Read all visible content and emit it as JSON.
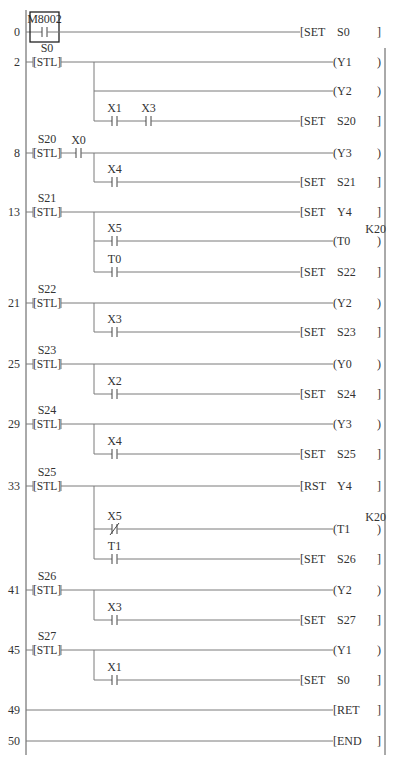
{
  "diagram": {
    "rails": {
      "left_x": 26,
      "right_x": 385,
      "top_y": 10,
      "bottom_y": 755
    },
    "branch_x": 94,
    "coil_x": 333,
    "rungs": [
      {
        "step": "0",
        "y": 32,
        "contacts": [
          {
            "name": "M8002",
            "x": 42,
            "type": "NO",
            "boxed": true
          }
        ],
        "output": {
          "kind": "func",
          "op": "SET",
          "arg": "S0"
        }
      },
      {
        "step": "2",
        "y": 62,
        "stl": "S0",
        "output": {
          "kind": "coil",
          "arg": "Y1"
        }
      },
      {
        "step": "",
        "y": 91,
        "branch": true,
        "output": {
          "kind": "coil",
          "arg": "Y2"
        }
      },
      {
        "step": "",
        "y": 121,
        "branch": true,
        "contacts": [
          {
            "name": "X1",
            "x": 112,
            "type": "NO"
          },
          {
            "name": "X3",
            "x": 146,
            "type": "NO"
          }
        ],
        "output": {
          "kind": "func",
          "op": "SET",
          "arg": "S20"
        }
      },
      {
        "step": "8",
        "y": 153,
        "stl": "S20",
        "contacts": [
          {
            "name": "X0",
            "x": 76,
            "type": "NO"
          }
        ],
        "output": {
          "kind": "coil",
          "arg": "Y3"
        }
      },
      {
        "step": "",
        "y": 182,
        "branch": true,
        "contacts": [
          {
            "name": "X4",
            "x": 112,
            "type": "NO"
          }
        ],
        "output": {
          "kind": "func",
          "op": "SET",
          "arg": "S21"
        }
      },
      {
        "step": "13",
        "y": 212,
        "stl": "S21",
        "output": {
          "kind": "func",
          "op": "SET",
          "arg": "Y4"
        }
      },
      {
        "step": "",
        "y": 241,
        "branch": true,
        "contacts": [
          {
            "name": "X5",
            "x": 112,
            "type": "NO"
          }
        ],
        "output": {
          "kind": "coil",
          "arg": "T0",
          "const": "K20"
        }
      },
      {
        "step": "",
        "y": 272,
        "branch": true,
        "contacts": [
          {
            "name": "T0",
            "x": 112,
            "type": "NO"
          }
        ],
        "output": {
          "kind": "func",
          "op": "SET",
          "arg": "S22"
        }
      },
      {
        "step": "21",
        "y": 303,
        "stl": "S22",
        "output": {
          "kind": "coil",
          "arg": "Y2"
        }
      },
      {
        "step": "",
        "y": 332,
        "branch": true,
        "contacts": [
          {
            "name": "X3",
            "x": 112,
            "type": "NO"
          }
        ],
        "output": {
          "kind": "func",
          "op": "SET",
          "arg": "S23"
        }
      },
      {
        "step": "25",
        "y": 364,
        "stl": "S23",
        "output": {
          "kind": "coil",
          "arg": "Y0"
        }
      },
      {
        "step": "",
        "y": 394,
        "branch": true,
        "contacts": [
          {
            "name": "X2",
            "x": 112,
            "type": "NO"
          }
        ],
        "output": {
          "kind": "func",
          "op": "SET",
          "arg": "S24"
        }
      },
      {
        "step": "29",
        "y": 424,
        "stl": "S24",
        "output": {
          "kind": "coil",
          "arg": "Y3"
        }
      },
      {
        "step": "",
        "y": 454,
        "branch": true,
        "contacts": [
          {
            "name": "X4",
            "x": 112,
            "type": "NO"
          }
        ],
        "output": {
          "kind": "func",
          "op": "SET",
          "arg": "S25"
        }
      },
      {
        "step": "33",
        "y": 486,
        "stl": "S25",
        "output": {
          "kind": "func",
          "op": "RST",
          "arg": "Y4"
        }
      },
      {
        "step": "",
        "y": 529,
        "branch": true,
        "contacts": [
          {
            "name": "X5",
            "x": 112,
            "type": "NC"
          }
        ],
        "output": {
          "kind": "coil",
          "arg": "T1",
          "const": "K20"
        }
      },
      {
        "step": "",
        "y": 559,
        "branch": true,
        "contacts": [
          {
            "name": "T1",
            "x": 112,
            "type": "NO"
          }
        ],
        "output": {
          "kind": "func",
          "op": "SET",
          "arg": "S26"
        }
      },
      {
        "step": "41",
        "y": 590,
        "stl": "S26",
        "output": {
          "kind": "coil",
          "arg": "Y2"
        }
      },
      {
        "step": "",
        "y": 620,
        "branch": true,
        "contacts": [
          {
            "name": "X3",
            "x": 112,
            "type": "NO"
          }
        ],
        "output": {
          "kind": "func",
          "op": "SET",
          "arg": "S27"
        }
      },
      {
        "step": "45",
        "y": 650,
        "stl": "S27",
        "output": {
          "kind": "coil",
          "arg": "Y1"
        }
      },
      {
        "step": "",
        "y": 680,
        "branch": true,
        "contacts": [
          {
            "name": "X1",
            "x": 112,
            "type": "NO"
          }
        ],
        "output": {
          "kind": "func",
          "op": "SET",
          "arg": "S0"
        }
      },
      {
        "step": "49",
        "y": 710,
        "output": {
          "kind": "func",
          "op": "RET",
          "arg": ""
        }
      },
      {
        "step": "50",
        "y": 741,
        "output": {
          "kind": "func",
          "op": "END",
          "arg": ""
        }
      }
    ],
    "branches": [
      {
        "from_y": 62,
        "to_y": 121
      },
      {
        "from_y": 153,
        "to_y": 182
      },
      {
        "from_y": 212,
        "to_y": 272
      },
      {
        "from_y": 303,
        "to_y": 332
      },
      {
        "from_y": 364,
        "to_y": 394
      },
      {
        "from_y": 424,
        "to_y": 454
      },
      {
        "from_y": 486,
        "to_y": 559
      },
      {
        "from_y": 590,
        "to_y": 620
      },
      {
        "from_y": 650,
        "to_y": 680
      }
    ],
    "colors": {
      "line": "#7a7a7a",
      "text": "#333333",
      "rail": "#555555",
      "box": "#222222"
    }
  }
}
